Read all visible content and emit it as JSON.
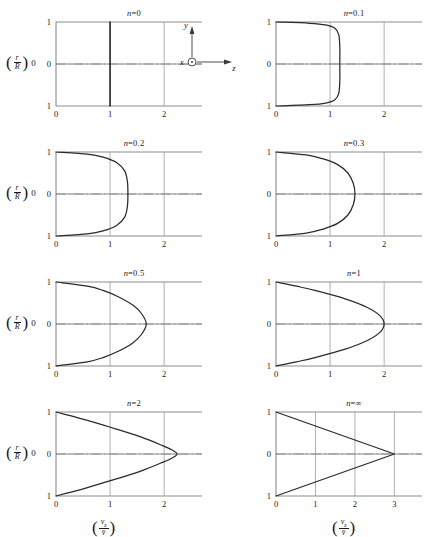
{
  "figure": {
    "y_axis_label": {
      "num": "r",
      "den": "R"
    },
    "x_axis_label": {
      "num": "v",
      "num_sub": "z",
      "den": "v̄"
    },
    "orientation_inset": {
      "x_label": "x",
      "y_label": "y",
      "z_label": "z",
      "x_icon": "axis-out-of-page-icon"
    }
  },
  "chart_data": {
    "type": "line",
    "xlabel": "(v_z / v̄)",
    "ylabel": "(r / R)",
    "grid": true,
    "legend": "none",
    "shared_ylim": [
      -1,
      1
    ],
    "shared_yticks": [
      1,
      0,
      1
    ],
    "note": "Each panel plots dimensionless axial velocity v_z/v̄ versus radial position r/R for a power-law index n. Centerline peak = (3n+1)/(n+1).",
    "panels": [
      {
        "id": "n0",
        "title_prefix": "n",
        "title_value": "=0",
        "n": 0,
        "xlim": [
          0,
          2.7
        ],
        "xticks": [
          0,
          1,
          2
        ],
        "peak": 1.0,
        "shape": "plug",
        "profile": [
          {
            "r": 1.0,
            "v": 1.0
          },
          {
            "r": 0.5,
            "v": 1.0
          },
          {
            "r": 0.0,
            "v": 1.0
          },
          {
            "r": -0.5,
            "v": 1.0
          },
          {
            "r": -1.0,
            "v": 1.0
          }
        ]
      },
      {
        "id": "n01",
        "title_prefix": "n",
        "title_value": "=0.1",
        "n": 0.1,
        "xlim": [
          0,
          2.7
        ],
        "xticks": [
          0,
          1,
          2
        ],
        "peak": 1.18,
        "shape": "near-plug",
        "profile": [
          {
            "r": 1.0,
            "v": 0.0
          },
          {
            "r": 0.97,
            "v": 0.62
          },
          {
            "r": 0.93,
            "v": 0.92
          },
          {
            "r": 0.85,
            "v": 1.09
          },
          {
            "r": 0.7,
            "v": 1.16
          },
          {
            "r": 0.4,
            "v": 1.18
          },
          {
            "r": 0.0,
            "v": 1.18
          },
          {
            "r": -0.4,
            "v": 1.18
          },
          {
            "r": -0.7,
            "v": 1.16
          },
          {
            "r": -0.85,
            "v": 1.09
          },
          {
            "r": -0.93,
            "v": 0.92
          },
          {
            "r": -0.97,
            "v": 0.62
          },
          {
            "r": -1.0,
            "v": 0.0
          }
        ]
      },
      {
        "id": "n02",
        "title_prefix": "n",
        "title_value": "=0.2",
        "n": 0.2,
        "xlim": [
          0,
          2.7
        ],
        "xticks": [
          0,
          1,
          2
        ],
        "peak": 1.33,
        "shape": "blunt",
        "profile": [
          {
            "r": 1.0,
            "v": 0.0
          },
          {
            "r": 0.95,
            "v": 0.58
          },
          {
            "r": 0.88,
            "v": 0.87
          },
          {
            "r": 0.75,
            "v": 1.12
          },
          {
            "r": 0.55,
            "v": 1.27
          },
          {
            "r": 0.3,
            "v": 1.32
          },
          {
            "r": 0.0,
            "v": 1.33
          },
          {
            "r": -0.3,
            "v": 1.32
          },
          {
            "r": -0.55,
            "v": 1.27
          },
          {
            "r": -0.75,
            "v": 1.12
          },
          {
            "r": -0.88,
            "v": 0.87
          },
          {
            "r": -0.95,
            "v": 0.58
          },
          {
            "r": -1.0,
            "v": 0.0
          }
        ]
      },
      {
        "id": "n03",
        "title_prefix": "n",
        "title_value": "=0.3",
        "n": 0.3,
        "xlim": [
          0,
          2.7
        ],
        "xticks": [
          0,
          1,
          2
        ],
        "peak": 1.46,
        "shape": "blunt",
        "profile": [
          {
            "r": 1.0,
            "v": 0.0
          },
          {
            "r": 0.93,
            "v": 0.56
          },
          {
            "r": 0.84,
            "v": 0.86
          },
          {
            "r": 0.7,
            "v": 1.14
          },
          {
            "r": 0.5,
            "v": 1.33
          },
          {
            "r": 0.25,
            "v": 1.43
          },
          {
            "r": 0.0,
            "v": 1.46
          },
          {
            "r": -0.25,
            "v": 1.43
          },
          {
            "r": -0.5,
            "v": 1.33
          },
          {
            "r": -0.7,
            "v": 1.14
          },
          {
            "r": -0.84,
            "v": 0.86
          },
          {
            "r": -0.93,
            "v": 0.56
          },
          {
            "r": -1.0,
            "v": 0.0
          }
        ]
      },
      {
        "id": "n05",
        "title_prefix": "n",
        "title_value": "=0.5",
        "n": 0.5,
        "xlim": [
          0,
          2.7
        ],
        "xticks": [
          0,
          1,
          2
        ],
        "peak": 1.67,
        "shape": "rounded",
        "profile": [
          {
            "r": 1.0,
            "v": 0.0
          },
          {
            "r": 0.9,
            "v": 0.58
          },
          {
            "r": 0.8,
            "v": 0.87
          },
          {
            "r": 0.65,
            "v": 1.15
          },
          {
            "r": 0.45,
            "v": 1.42
          },
          {
            "r": 0.25,
            "v": 1.58
          },
          {
            "r": 0.0,
            "v": 1.67
          },
          {
            "r": -0.25,
            "v": 1.58
          },
          {
            "r": -0.45,
            "v": 1.42
          },
          {
            "r": -0.65,
            "v": 1.15
          },
          {
            "r": -0.8,
            "v": 0.87
          },
          {
            "r": -0.9,
            "v": 0.58
          },
          {
            "r": -1.0,
            "v": 0.0
          }
        ]
      },
      {
        "id": "n1",
        "title_prefix": "n",
        "title_value": "=1",
        "n": 1,
        "xlim": [
          0,
          2.7
        ],
        "xticks": [
          0,
          1,
          2
        ],
        "peak": 2.0,
        "shape": "parabolic",
        "profile": [
          {
            "r": 1.0,
            "v": 0.0
          },
          {
            "r": 0.9,
            "v": 0.38
          },
          {
            "r": 0.8,
            "v": 0.72
          },
          {
            "r": 0.6,
            "v": 1.28
          },
          {
            "r": 0.4,
            "v": 1.68
          },
          {
            "r": 0.2,
            "v": 1.92
          },
          {
            "r": 0.0,
            "v": 2.0
          },
          {
            "r": -0.2,
            "v": 1.92
          },
          {
            "r": -0.4,
            "v": 1.68
          },
          {
            "r": -0.6,
            "v": 1.28
          },
          {
            "r": -0.8,
            "v": 0.72
          },
          {
            "r": -0.9,
            "v": 0.38
          },
          {
            "r": -1.0,
            "v": 0.0
          }
        ]
      },
      {
        "id": "n2",
        "title_prefix": "n",
        "title_value": "=2",
        "n": 2,
        "xlim": [
          0,
          2.7
        ],
        "xticks": [
          0,
          1,
          2
        ],
        "peak": 2.24,
        "shape": "pointed",
        "profile": [
          {
            "r": 1.0,
            "v": 0.0
          },
          {
            "r": 0.9,
            "v": 0.3
          },
          {
            "r": 0.8,
            "v": 0.58
          },
          {
            "r": 0.6,
            "v": 1.1
          },
          {
            "r": 0.4,
            "v": 1.58
          },
          {
            "r": 0.2,
            "v": 1.97
          },
          {
            "r": 0.1,
            "v": 2.14
          },
          {
            "r": 0.0,
            "v": 2.24
          },
          {
            "r": -0.1,
            "v": 2.14
          },
          {
            "r": -0.2,
            "v": 1.97
          },
          {
            "r": -0.4,
            "v": 1.58
          },
          {
            "r": -0.6,
            "v": 1.1
          },
          {
            "r": -0.8,
            "v": 0.58
          },
          {
            "r": -0.9,
            "v": 0.3
          },
          {
            "r": -1.0,
            "v": 0.0
          }
        ]
      },
      {
        "id": "ninf",
        "title_prefix": "n",
        "title_value": "=∞",
        "n": "∞",
        "xlim": [
          0,
          3.7
        ],
        "xticks": [
          0,
          1,
          2,
          3
        ],
        "peak": 3.0,
        "shape": "triangular",
        "profile": [
          {
            "r": 1.0,
            "v": 0.0
          },
          {
            "r": 0.5,
            "v": 1.5
          },
          {
            "r": 0.0,
            "v": 3.0
          },
          {
            "r": -0.5,
            "v": 1.5
          },
          {
            "r": -1.0,
            "v": 0.0
          }
        ]
      }
    ]
  }
}
